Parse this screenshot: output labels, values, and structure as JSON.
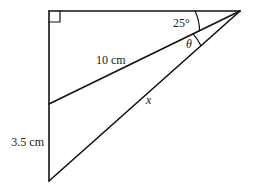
{
  "diagram": {
    "type": "geometry-right-triangle",
    "colors": {
      "stroke": "#111111",
      "text": "#222222",
      "background": "#ffffff"
    },
    "labels": {
      "angle_top": "25°",
      "angle_theta": "θ",
      "hypotenuse_inner": "10 cm",
      "hypotenuse_outer": "x",
      "left_lower_segment": "3.5 cm"
    },
    "marks": [
      "right-angle at top-left"
    ]
  }
}
